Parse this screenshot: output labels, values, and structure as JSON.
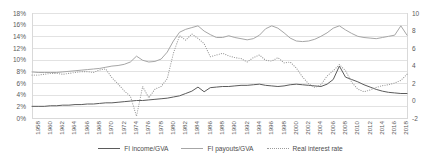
{
  "chart_data": {
    "type": "line",
    "title": "",
    "xlabel": "",
    "ylabel": "",
    "grid": true,
    "legend_position": "bottom",
    "x": [
      1958,
      1959,
      1960,
      1961,
      1962,
      1963,
      1964,
      1965,
      1966,
      1967,
      1968,
      1969,
      1970,
      1971,
      1972,
      1973,
      1974,
      1975,
      1976,
      1977,
      1978,
      1979,
      1980,
      1981,
      1982,
      1983,
      1984,
      1985,
      1986,
      1987,
      1988,
      1989,
      1990,
      1991,
      1992,
      1993,
      1994,
      1995,
      1996,
      1997,
      1998,
      1999,
      2000,
      2001,
      2002,
      2003,
      2004,
      2005,
      2006,
      2007,
      2008,
      2009,
      2010,
      2011,
      2012,
      2013,
      2014,
      2015,
      2016,
      2017,
      2018,
      2019
    ],
    "xtick_labels": [
      "1958",
      "1960",
      "1962",
      "1964",
      "1966",
      "1968",
      "1970",
      "1972",
      "1974",
      "1976",
      "1978",
      "1980",
      "1982",
      "1984",
      "1986",
      "1988",
      "1990",
      "1992",
      "1994",
      "1996",
      "1998",
      "2000",
      "2002",
      "2004",
      "2006",
      "2008",
      "2010",
      "2012",
      "2014",
      "2016",
      "2018"
    ],
    "left_axis": {
      "ticks": [
        "0%",
        "2%",
        "4%",
        "6%",
        "8%",
        "10%",
        "12%",
        "14%",
        "16%",
        "18%"
      ],
      "values": [
        0,
        2,
        4,
        6,
        8,
        10,
        12,
        14,
        16,
        18
      ],
      "min": 0,
      "max": 18
    },
    "right_axis": {
      "ticks": [
        "-2",
        "0",
        "2",
        "4",
        "6",
        "8",
        "10"
      ],
      "values": [
        -2,
        0,
        2,
        4,
        6,
        8,
        10
      ],
      "min": -2,
      "max": 10
    },
    "series": [
      {
        "name": "FI income/GVA",
        "axis": "left",
        "style": "solid",
        "color": "#5b5b5b",
        "values": [
          2.0,
          2.0,
          2.0,
          2.1,
          2.1,
          2.2,
          2.2,
          2.3,
          2.3,
          2.4,
          2.4,
          2.5,
          2.6,
          2.6,
          2.7,
          2.8,
          2.9,
          3.0,
          3.0,
          3.1,
          3.2,
          3.3,
          3.4,
          3.6,
          3.8,
          4.2,
          4.6,
          5.3,
          4.5,
          5.2,
          5.3,
          5.4,
          5.4,
          5.5,
          5.6,
          5.6,
          5.7,
          5.8,
          5.6,
          5.5,
          5.4,
          5.5,
          5.7,
          5.8,
          5.7,
          5.6,
          5.5,
          5.4,
          5.8,
          6.6,
          8.9,
          7.0,
          6.6,
          6.2,
          5.7,
          5.3,
          4.9,
          4.6,
          4.4,
          4.3,
          4.2,
          4.2
        ]
      },
      {
        "name": "FI payouts/GVA",
        "axis": "left",
        "style": "solid",
        "color": "#a6a6a6",
        "values": [
          7.9,
          7.8,
          7.8,
          7.8,
          7.8,
          7.9,
          8.0,
          8.1,
          8.2,
          8.3,
          8.4,
          8.5,
          8.7,
          8.9,
          9.0,
          9.2,
          9.6,
          10.6,
          9.9,
          9.6,
          9.7,
          10.1,
          11.3,
          13.2,
          14.7,
          15.2,
          15.5,
          15.8,
          14.9,
          14.3,
          13.8,
          13.8,
          14.1,
          13.8,
          13.6,
          13.4,
          13.6,
          14.2,
          15.3,
          15.8,
          15.4,
          14.6,
          13.7,
          13.2,
          13.1,
          13.2,
          13.5,
          14.0,
          14.6,
          15.4,
          15.8,
          15.1,
          14.5,
          14.0,
          13.8,
          13.7,
          13.6,
          13.8,
          14.0,
          14.2,
          15.8,
          14.2
        ]
      },
      {
        "name": "Real interest rate",
        "axis": "right",
        "style": "dotted",
        "color": "#9a9a9a",
        "values": [
          2.9,
          2.9,
          3.0,
          3.1,
          3.1,
          3.0,
          3.1,
          3.2,
          3.3,
          3.3,
          3.2,
          3.5,
          3.6,
          2.6,
          1.9,
          1.1,
          0.5,
          -1.8,
          1.6,
          0.3,
          1.3,
          1.6,
          2.5,
          5.4,
          7.4,
          6.9,
          7.6,
          7.1,
          6.5,
          5.0,
          5.2,
          5.4,
          5.1,
          4.9,
          4.8,
          4.4,
          4.9,
          5.2,
          4.6,
          4.5,
          4.9,
          4.3,
          4.4,
          3.7,
          2.7,
          1.9,
          1.5,
          1.8,
          2.8,
          3.4,
          4.1,
          3.4,
          2.1,
          1.3,
          1.0,
          1.2,
          1.5,
          1.7,
          1.8,
          2.0,
          2.3,
          3.0
        ]
      }
    ]
  },
  "legend": {
    "items": [
      {
        "label": "FI income/GVA",
        "style": "solid-dark"
      },
      {
        "label": "FI payouts/GVA",
        "style": "solid-light"
      },
      {
        "label": "Real interest rate",
        "style": "dotted"
      }
    ]
  }
}
